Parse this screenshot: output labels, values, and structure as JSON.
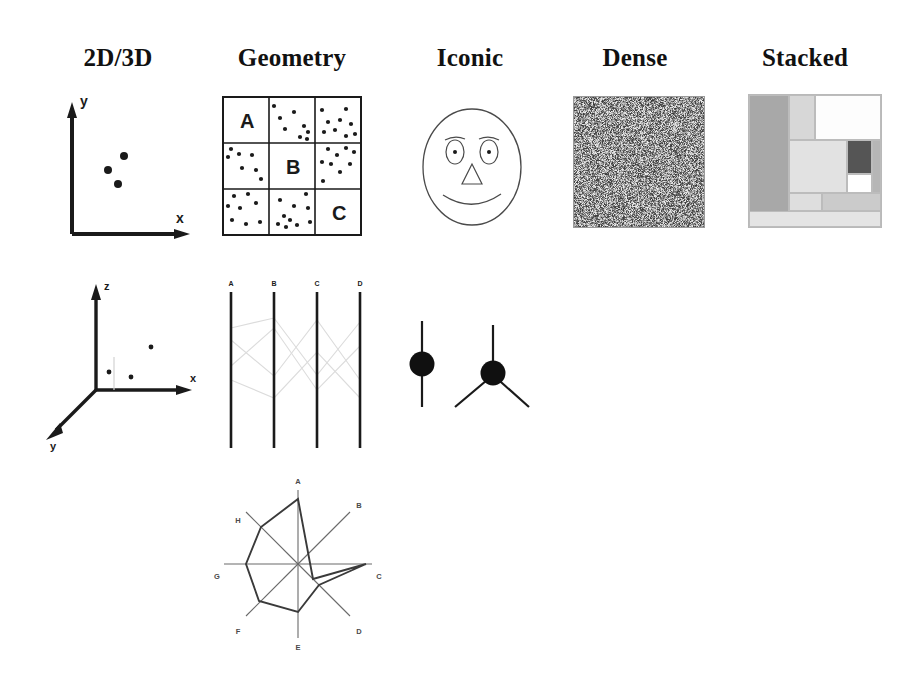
{
  "figure": {
    "background_color": "#ffffff",
    "ink_color": "#1a1a1a",
    "faint_color": "#c9c9c9"
  },
  "columns": [
    {
      "id": "col-2d3d",
      "label": "2D/3D",
      "center_x": 118
    },
    {
      "id": "col-geometry",
      "label": "Geometry",
      "center_x": 292
    },
    {
      "id": "col-iconic",
      "label": "Iconic",
      "center_x": 470
    },
    {
      "id": "col-dense",
      "label": "Dense",
      "center_x": 635
    },
    {
      "id": "col-stacked",
      "label": "Stacked",
      "center_x": 805
    }
  ],
  "panels": {
    "scatter_2d": {
      "name": "2D scatter plot",
      "axis_labels": {
        "x": "x",
        "y": "y"
      },
      "points": [
        {
          "x": 0.42,
          "y": 0.44
        },
        {
          "x": 0.57,
          "y": 0.53
        },
        {
          "x": 0.5,
          "y": 0.35
        }
      ]
    },
    "scatter_3d": {
      "name": "3D scatter plot",
      "axis_labels": {
        "x": "x",
        "y": "y",
        "z": "z"
      },
      "points": [
        {
          "left": 35,
          "top": 100
        },
        {
          "left": 60,
          "top": 108
        },
        {
          "left": 90,
          "top": 77
        }
      ]
    },
    "geometry_grid": {
      "name": "Binned scatter grid",
      "rows": 3,
      "cols": 3,
      "labeled_cells": [
        {
          "row": 0,
          "col": 0,
          "label": "A"
        },
        {
          "row": 1,
          "col": 1,
          "label": "B"
        },
        {
          "row": 2,
          "col": 2,
          "label": "C"
        }
      ],
      "dot_counts": [
        [
          0,
          8,
          9
        ],
        [
          7,
          0,
          9
        ],
        [
          8,
          10,
          0
        ]
      ]
    },
    "parallel_coords": {
      "name": "Parallel coordinates plot",
      "axes": [
        "A",
        "B",
        "C",
        "D"
      ],
      "series_count": 4
    },
    "star_plot": {
      "name": "Star / radar glyph plot",
      "axes": [
        "A",
        "B",
        "C",
        "D",
        "E",
        "F",
        "G",
        "H"
      ],
      "values": [
        0.88,
        0.28,
        0.92,
        0.4,
        0.62,
        0.68,
        0.55,
        0.72
      ]
    },
    "chernoff_face": {
      "name": "Chernoff face glyph",
      "features": [
        "head",
        "left-eyebrow",
        "right-eyebrow",
        "left-eye",
        "right-eye",
        "nose",
        "mouth"
      ]
    },
    "node_glyphs": {
      "name": "Node-link glyphs",
      "glyphs": [
        {
          "id": "glyph-degree-2",
          "spokes": 2
        },
        {
          "id": "glyph-degree-3",
          "spokes": 3
        }
      ]
    },
    "dense_pixels": {
      "name": "Dense pixel display",
      "size_px": 130,
      "pattern": "random-gray-noise",
      "mean_gray": "#8c8c8c"
    },
    "treemap": {
      "name": "Stacked treemap display",
      "rects": [
        {
          "id": "tm-1",
          "left": 0,
          "top": 0,
          "w": 30,
          "h": 100,
          "fill": "#a8a8a8"
        },
        {
          "id": "tm-2",
          "left": 30,
          "top": 0,
          "w": 20,
          "h": 34,
          "fill": "#d7d7d7"
        },
        {
          "id": "tm-3",
          "left": 50,
          "top": 0,
          "w": 50,
          "h": 34,
          "fill": "#fdfdfd"
        },
        {
          "id": "tm-4",
          "left": 30,
          "top": 34,
          "w": 44,
          "h": 40,
          "fill": "#e2e2e2"
        },
        {
          "id": "tm-5",
          "left": 74,
          "top": 34,
          "w": 19,
          "h": 26,
          "fill": "#555555"
        },
        {
          "id": "tm-6",
          "left": 93,
          "top": 34,
          "w": 7,
          "h": 40,
          "fill": "#b6b6b6"
        },
        {
          "id": "tm-7",
          "left": 74,
          "top": 60,
          "w": 19,
          "h": 14,
          "fill": "#ffffff"
        },
        {
          "id": "tm-8",
          "left": 30,
          "top": 74,
          "w": 25,
          "h": 14,
          "fill": "#dedede"
        },
        {
          "id": "tm-9",
          "left": 55,
          "top": 74,
          "w": 45,
          "h": 14,
          "fill": "#cbcbcb"
        },
        {
          "id": "tm-10",
          "left": 0,
          "top": 88,
          "w": 100,
          "h": 12,
          "fill": "#e4e4e4"
        }
      ]
    }
  }
}
